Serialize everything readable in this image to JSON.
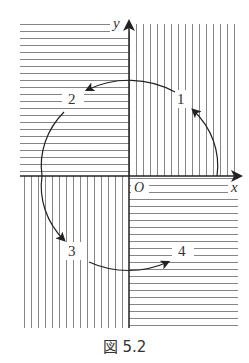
{
  "figure": {
    "caption": "図 5.2",
    "axes": {
      "x_label": "x",
      "y_label": "y",
      "origin_label": "O"
    },
    "quadrant_labels": [
      "1",
      "2",
      "3",
      "4"
    ]
  },
  "colors": {
    "line": "#222222",
    "hatch": "#555555",
    "background": "#ffffff"
  }
}
